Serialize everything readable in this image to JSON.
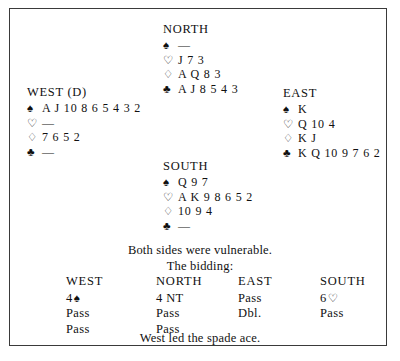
{
  "symbols": {
    "spade": "♠",
    "heart": "♡",
    "diamond": "♢",
    "club": "♣",
    "void": "—"
  },
  "hands": {
    "north": {
      "label": "NORTH",
      "spades": "—",
      "hearts": "J 7 3",
      "diamonds": "A Q 8 3",
      "clubs": "A J 8 5 4 3"
    },
    "west": {
      "label": "WEST (D)",
      "spades": "A J 10 8 6 5 4 3 2",
      "hearts": "—",
      "diamonds": "7 6 5 2",
      "clubs": "—"
    },
    "east": {
      "label": "EAST",
      "spades": "K",
      "hearts": "Q 10 4",
      "diamonds": "K J",
      "clubs": "K Q 10 9 7 6 2"
    },
    "south": {
      "label": "SOUTH",
      "spades": "Q 9 7",
      "hearts": "A K 9 8 6 5 2",
      "diamonds": "10 9 4",
      "clubs": "—"
    }
  },
  "vulnerability_note": "Both sides were vulnerable.",
  "bidding_caption": "The bidding:",
  "bidding": {
    "headers": {
      "west": "WEST",
      "north": "NORTH",
      "east": "EAST",
      "south": "SOUTH"
    },
    "rows": [
      {
        "west": "4",
        "west_suit": "♠",
        "north": "4 NT",
        "north_suit": "",
        "east": "Pass",
        "east_suit": "",
        "south": "6",
        "south_suit": "♡"
      },
      {
        "west": "Pass",
        "west_suit": "",
        "north": "Pass",
        "north_suit": "",
        "east": "Dbl.",
        "east_suit": "",
        "south": "Pass",
        "south_suit": ""
      },
      {
        "west": "Pass",
        "west_suit": "",
        "north": "Pass",
        "north_suit": "",
        "east": "",
        "east_suit": "",
        "south": "",
        "south_suit": ""
      }
    ]
  },
  "lead_note": "West led the spade ace."
}
